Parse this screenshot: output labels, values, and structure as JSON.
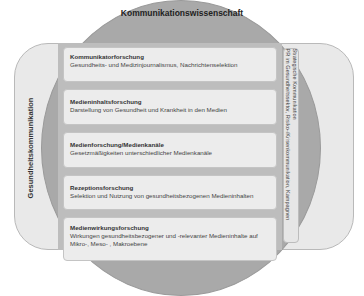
{
  "diagram": {
    "top_label": "Kommunikationswissenschaft",
    "left_label": "Gesundheitskommunikation",
    "right_panel": {
      "title": "Strategische Kommunikation",
      "description": "PR im Gesundheitssektor, Risiko-/Krisenkommunikation, Kampagnen"
    },
    "boxes": [
      {
        "title": "Kommunikatorforschung",
        "description": "Gesundheits- und Medizinjournalismus, Nachrichtenselektion"
      },
      {
        "title": "Medieninhaltsforschung",
        "description": "Darstellung von Gesundheit und Krankheit in den Medien"
      },
      {
        "title": "Medienforschung/Medienkanäle",
        "description": "Gesetzmäßigkeiten unterschiedlicher Medienkanäle"
      },
      {
        "title": "Rezeptionsforschung",
        "description": "Selektion und Nutzung von gesundheitsbezogenen Medieninhalten"
      },
      {
        "title": "Medienwirkungsforschung",
        "description": "Wirkungen gesundheitsbezogener und -relevanter Medieninhalte auf Mikro-, Meso- , Makroebene"
      }
    ],
    "colors": {
      "circle": "#a9a9a9",
      "outer_rect": "#e9e9e9",
      "box": "#ececec"
    }
  }
}
